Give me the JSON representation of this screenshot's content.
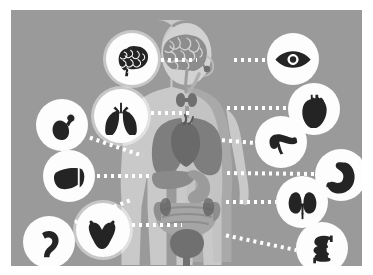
{
  "figure": {
    "background_color": "#9a9a9a",
    "frame_color": "#ffffff",
    "bubble_color": "#fdfdfd",
    "glyph_color": "#242424",
    "connector_color": "#ffffff"
  },
  "body": {
    "silhouette_color": "#c9c9c9",
    "silhouette_shadow_color": "#b5b5b5",
    "parts": [
      {
        "name": "brain",
        "color": "#8d8d8d"
      },
      {
        "name": "spinal-cord",
        "color": "#8d8d8d"
      },
      {
        "name": "thyroid",
        "color": "#6f6f6f"
      },
      {
        "name": "trachea",
        "color": "#9d9d9d"
      },
      {
        "name": "lungs",
        "color": "#7e7e7e"
      },
      {
        "name": "heart",
        "color": "#6a6a6a"
      },
      {
        "name": "liver",
        "color": "#8a8a8a"
      },
      {
        "name": "stomach",
        "color": "#9b9b9b"
      },
      {
        "name": "intestines",
        "color": "#a5a5a5"
      },
      {
        "name": "kidneys",
        "color": "#5f5f5f"
      },
      {
        "name": "bladder",
        "color": "#707070"
      }
    ]
  },
  "organs": [
    {
      "id": "brain",
      "label": "Brain",
      "icon": "brain-icon",
      "cx": 121,
      "cy": 49,
      "r": 26,
      "halo": true
    },
    {
      "id": "eye",
      "label": "Eye",
      "icon": "eye-icon",
      "cx": 282,
      "cy": 49,
      "r": 26,
      "halo": false
    },
    {
      "id": "heart",
      "label": "Heart",
      "icon": "heart-icon",
      "cx": 303,
      "cy": 99,
      "r": 26,
      "halo": false
    },
    {
      "id": "gallbladder",
      "label": "Gallbladder",
      "icon": "gallbladder-icon",
      "cx": 51,
      "cy": 115,
      "r": 26,
      "halo": false
    },
    {
      "id": "lungs",
      "label": "Lungs",
      "icon": "lungs-icon",
      "cx": 110,
      "cy": 106,
      "r": 27,
      "halo": true
    },
    {
      "id": "pancreas",
      "label": "Pancreas",
      "icon": "pancreas-icon",
      "cx": 270,
      "cy": 132,
      "r": 26,
      "halo": false
    },
    {
      "id": "liver",
      "label": "Liver",
      "icon": "liver-icon",
      "cx": 58,
      "cy": 166,
      "r": 26,
      "halo": false
    },
    {
      "id": "stomach",
      "label": "Stomach",
      "icon": "stomach-icon",
      "cx": 330,
      "cy": 165,
      "r": 26,
      "halo": false
    },
    {
      "id": "kidneys",
      "label": "Kidneys",
      "icon": "kidneys-icon",
      "cx": 291,
      "cy": 192,
      "r": 26,
      "halo": false
    },
    {
      "id": "uterus",
      "label": "Uterus",
      "icon": "uterus-icon",
      "cx": 92,
      "cy": 220,
      "r": 27,
      "halo": true
    },
    {
      "id": "colon",
      "label": "Colon",
      "icon": "colon-icon",
      "cx": 38,
      "cy": 232,
      "r": 26,
      "halo": false
    },
    {
      "id": "intestine",
      "label": "Small intestine",
      "icon": "intestine-icon",
      "cx": 311,
      "cy": 238,
      "r": 26,
      "halo": false
    }
  ],
  "connectors": [
    {
      "from": "brain",
      "x1": 148,
      "y1": 50,
      "x2": 186,
      "y2": 50
    },
    {
      "from": "eye",
      "x1": 221,
      "y1": 50,
      "x2": 256,
      "y2": 50
    },
    {
      "from": "lungs",
      "x1": 138,
      "y1": 103,
      "x2": 181,
      "y2": 103
    },
    {
      "from": "heart",
      "x1": 214,
      "y1": 98,
      "x2": 277,
      "y2": 98
    },
    {
      "from": "gallbladder",
      "x1": 77,
      "y1": 127,
      "x2": 132,
      "y2": 146
    },
    {
      "from": "pancreas",
      "x1": 209,
      "y1": 130,
      "x2": 244,
      "y2": 133
    },
    {
      "from": "liver",
      "x1": 84,
      "y1": 166,
      "x2": 140,
      "y2": 166
    },
    {
      "from": "stomach",
      "x1": 214,
      "y1": 163,
      "x2": 304,
      "y2": 164
    },
    {
      "from": "kidneys",
      "x1": 213,
      "y1": 192,
      "x2": 265,
      "y2": 192
    },
    {
      "from": "uterus",
      "x1": 119,
      "y1": 215,
      "x2": 171,
      "y2": 215
    },
    {
      "from": "colon",
      "x1": 62,
      "y1": 213,
      "x2": 120,
      "y2": 190
    },
    {
      "from": "intestine",
      "x1": 213,
      "y1": 225,
      "x2": 285,
      "y2": 240
    }
  ]
}
